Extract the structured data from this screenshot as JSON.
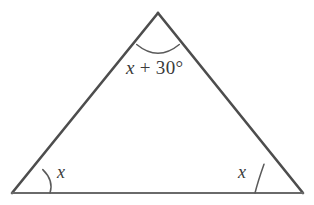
{
  "figure": {
    "name": "isosceles-triangle-angle-diagram",
    "background_color": "#ffffff",
    "line_color": "#4d4d4d",
    "base_line_color": "#6a6a6a",
    "arc_color": "#5a5a5a",
    "text_color": "#3a3a3a"
  },
  "vertices": {
    "apex": {
      "x": 158,
      "y": 13
    },
    "bottom_left": {
      "x": 12,
      "y": 193
    },
    "bottom_right": {
      "x": 303,
      "y": 193
    }
  },
  "labels": {
    "apex_angle": {
      "variable": "x",
      "operator": "+",
      "value": "30°",
      "full": "x + 30°"
    },
    "left_angle": "x",
    "right_angle": "x"
  },
  "arcs": {
    "apex": {
      "radius": 38,
      "center_x": 158,
      "center_y": 13
    },
    "left": {
      "radius": 38,
      "center_x": 12,
      "center_y": 193
    },
    "right": {
      "radius": 48,
      "center_x": 303,
      "center_y": 193
    }
  },
  "paths": {
    "left_side": "M 12 193 L 158 13",
    "right_side": "M 158 13 L 303 193",
    "base": "M 12 193 L 303 193",
    "apex_arc": "M 136.7 44.5 Q 158 62 179.3 44.5",
    "left_arc": "M 42.8 169.6 Q 54 180.5 50 193",
    "right_arc": "M 264.0 164.2 Q 258 181 255 193"
  }
}
